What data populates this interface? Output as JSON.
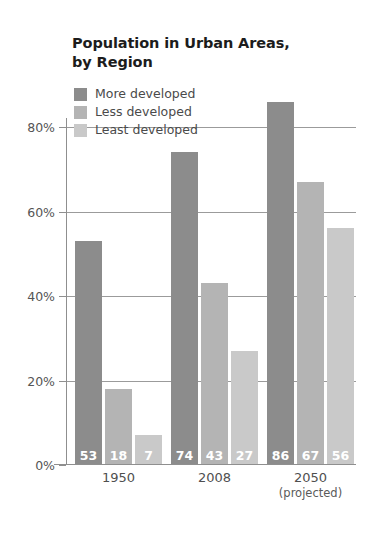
{
  "chart_data": {
    "type": "bar",
    "title": "Population in Urban Areas, by Region",
    "title_lines": [
      "Population in Urban Areas,",
      "by Region"
    ],
    "xlabel": "",
    "ylabel": "",
    "ylim": [
      0,
      88
    ],
    "grid": true,
    "legend_position": "top-left",
    "categories": [
      "1950",
      "2008",
      "2050"
    ],
    "category_sublabels": [
      "",
      "",
      "(projected)"
    ],
    "yticks": [
      0,
      20,
      40,
      60,
      80
    ],
    "ytick_labels": [
      "0%",
      "20%",
      "40%",
      "60%",
      "80%"
    ],
    "series": [
      {
        "name": "More developed",
        "color": "#8c8c8c",
        "values": [
          53,
          74,
          86
        ]
      },
      {
        "name": "Less developed",
        "color": "#b4b4b4",
        "values": [
          18,
          43,
          67
        ]
      },
      {
        "name": "Least developed",
        "color": "#c9c9c9",
        "values": [
          7,
          27,
          56
        ]
      }
    ],
    "data_labels": [
      [
        "53",
        "18",
        "7"
      ],
      [
        "74",
        "43",
        "27"
      ],
      [
        "86",
        "67",
        "56"
      ]
    ]
  },
  "legend": {
    "items": [
      {
        "label": "More developed",
        "color": "#8c8c8c"
      },
      {
        "label": "Less developed",
        "color": "#b4b4b4"
      },
      {
        "label": "Least developed",
        "color": "#c9c9c9"
      }
    ]
  },
  "axis": {
    "y_tick_labels": [
      "80%",
      "60%",
      "40%",
      "20%",
      "0%"
    ],
    "x_tick_labels": [
      "1950",
      "2008",
      "2050"
    ],
    "x_tick_sublabels": [
      "",
      "",
      "(projected)"
    ]
  },
  "colors": {
    "background": "#ffffff",
    "gridline": "#9b9b9b",
    "axis": "#8f8f8f",
    "title_text": "#1c1c1c",
    "label_text": "#4f4f4f",
    "value_text": "#ffffff"
  }
}
